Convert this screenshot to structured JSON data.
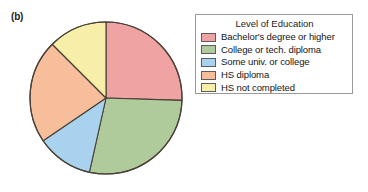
{
  "panel": {
    "label": "(b)"
  },
  "legend": {
    "title": "Level of Education",
    "position": "right"
  },
  "chart_data": {
    "type": "pie",
    "title": "Level of Education",
    "xlabel": "",
    "ylabel": "",
    "start_angle_deg": 0,
    "direction": "clockwise",
    "categories": [
      "Bachelor's degree or higher",
      "College or tech. diploma",
      "Some univ. or college",
      "HS diploma",
      "HS not completed"
    ],
    "values": [
      25.5,
      28.0,
      12.0,
      22.0,
      12.5
    ],
    "units": "percent",
    "colors": [
      "#EFA3A3",
      "#AFCB9C",
      "#A9D2EF",
      "#F6BE9B",
      "#F7EFA9"
    ],
    "slices": [
      {
        "label": "Bachelor's degree or higher",
        "value": 25.5,
        "color": "#EFA3A3",
        "start_deg": 0.0,
        "end_deg": 91.8
      },
      {
        "label": "College or tech. diploma",
        "value": 28.0,
        "color": "#AFCB9C",
        "start_deg": 91.8,
        "end_deg": 192.6
      },
      {
        "label": "Some univ. or college",
        "value": 12.0,
        "color": "#A9D2EF",
        "start_deg": 192.6,
        "end_deg": 235.8
      },
      {
        "label": "HS diploma",
        "value": 22.0,
        "color": "#F6BE9B",
        "start_deg": 235.8,
        "end_deg": 315.0
      },
      {
        "label": "HS not completed",
        "value": 12.5,
        "color": "#F7EFA9",
        "start_deg": 315.0,
        "end_deg": 360.0
      }
    ]
  }
}
